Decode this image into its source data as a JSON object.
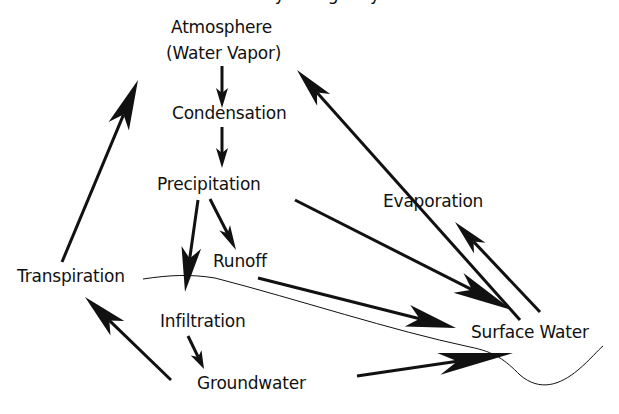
{
  "diagram": {
    "title": "Hydrologic Cycle",
    "colors": {
      "ink": "#111111",
      "background": "#ffffff"
    },
    "nodes": [
      {
        "id": "atmosphere",
        "label": "Atmosphere",
        "x": 171,
        "y": 17
      },
      {
        "id": "water-vapor",
        "label": "(Water Vapor)",
        "x": 166,
        "y": 43
      },
      {
        "id": "condensation",
        "label": "Condensation",
        "x": 172,
        "y": 103
      },
      {
        "id": "precipitation",
        "label": "Precipitation",
        "x": 157,
        "y": 174
      },
      {
        "id": "evaporation",
        "label": "Evaporation",
        "x": 383,
        "y": 191
      },
      {
        "id": "runoff",
        "label": "Runoff",
        "x": 213,
        "y": 251
      },
      {
        "id": "transpiration",
        "label": "Transpiration",
        "x": 17,
        "y": 266
      },
      {
        "id": "infiltration",
        "label": "Infiltration",
        "x": 160,
        "y": 311
      },
      {
        "id": "surface-water",
        "label": "Surface Water",
        "x": 471,
        "y": 322
      },
      {
        "id": "groundwater",
        "label": "Groundwater",
        "x": 197,
        "y": 373
      }
    ],
    "arrows": [
      {
        "id": "atmosphere-to-condensation",
        "from": [
          222,
          66
        ],
        "to": [
          222,
          108
        ],
        "head": 20
      },
      {
        "id": "condensation-to-precipitation",
        "from": [
          222,
          127
        ],
        "to": [
          222,
          168
        ],
        "head": 20
      },
      {
        "id": "surface-to-atmosphere",
        "from": [
          520,
          320
        ],
        "to": [
          297,
          70
        ],
        "head": 40
      },
      {
        "id": "surface-to-evaporation",
        "from": [
          540,
          312
        ],
        "to": [
          455,
          222
        ],
        "head": 36
      },
      {
        "id": "transpiration-to-atmosphere",
        "from": [
          62,
          262
        ],
        "to": [
          138,
          80
        ],
        "head": 50
      },
      {
        "id": "precipitation-to-surface",
        "from": [
          295,
          200
        ],
        "to": [
          512,
          310
        ],
        "head": 60
      },
      {
        "id": "runoff-to-surface",
        "from": [
          258,
          278
        ],
        "to": [
          456,
          328
        ],
        "head": 50
      },
      {
        "id": "precipitation-to-infiltration",
        "from": [
          198,
          200
        ],
        "to": [
          185,
          292
        ],
        "head": 45
      },
      {
        "id": "precipitation-to-runoff",
        "from": [
          210,
          199
        ],
        "to": [
          236,
          250
        ],
        "head": 25
      },
      {
        "id": "infiltration-to-groundwater",
        "from": [
          188,
          336
        ],
        "to": [
          204,
          369
        ],
        "head": 18
      },
      {
        "id": "groundwater-to-transpiration",
        "from": [
          171,
          380
        ],
        "to": [
          85,
          297
        ],
        "head": 45
      },
      {
        "id": "groundwater-to-surface",
        "from": [
          357,
          376
        ],
        "to": [
          513,
          353
        ],
        "head": 75
      }
    ],
    "ground_line": "M 143 279 C 170 275, 190 274, 215 278 C 300 300, 390 330, 470 347 C 495 352, 505 360, 520 375 C 540 392, 560 385, 578 370 C 590 360, 598 350, 603 346"
  }
}
